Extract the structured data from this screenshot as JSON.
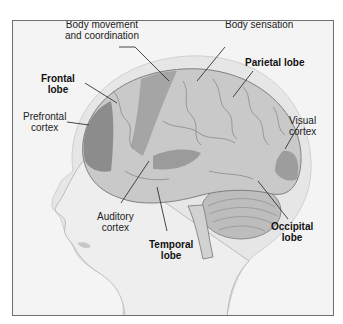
{
  "diagram": {
    "labels": [
      {
        "id": "body-movement",
        "line1": "Body movement",
        "line2": "and coordination",
        "bold": false
      },
      {
        "id": "body-sensation",
        "line1": "Body sensation",
        "line2": "",
        "bold": false
      },
      {
        "id": "frontal-lobe",
        "line1": "Frontal",
        "line2": "lobe",
        "bold": true
      },
      {
        "id": "parietal-lobe",
        "line1": "Parietal lobe",
        "line2": "",
        "bold": true
      },
      {
        "id": "prefrontal-cortex",
        "line1": "Prefrontal",
        "line2": "cortex",
        "bold": false
      },
      {
        "id": "visual-cortex",
        "line1": "Visual",
        "line2": "cortex",
        "bold": false
      },
      {
        "id": "auditory-cortex",
        "line1": "Auditory",
        "line2": "cortex",
        "bold": false
      },
      {
        "id": "temporal-lobe",
        "line1": "Temporal",
        "line2": "lobe",
        "bold": true
      },
      {
        "id": "occipital-lobe",
        "line1": "Occipital",
        "line2": "lobe",
        "bold": true
      }
    ],
    "colors": {
      "frame_border": "#6e6e6e",
      "background": "#f4f4f4",
      "skull_halo": "#e2e2e2",
      "brain_light": "#c9c9c9",
      "brain_mid": "#a8a8a8",
      "brain_dark": "#7a7a7a",
      "skin": "#ececec",
      "leader_line": "#333333"
    }
  }
}
